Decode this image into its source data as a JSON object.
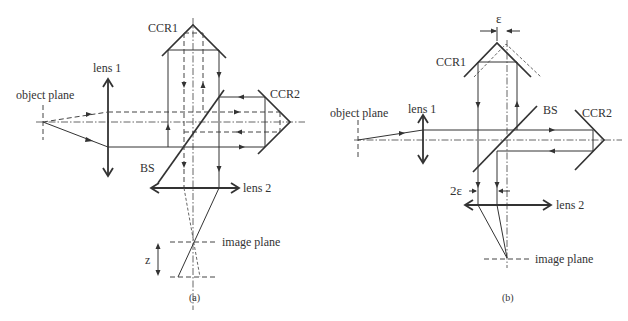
{
  "figure": {
    "panel_a": {
      "caption": "(a)",
      "labels": {
        "ccr1": "CCR1",
        "ccr2": "CCR2",
        "lens1": "lens 1",
        "lens2": "lens 2",
        "object_plane": "object plane",
        "bs": "BS",
        "image_plane": "image plane",
        "z": "z"
      }
    },
    "panel_b": {
      "caption": "(b)",
      "labels": {
        "ccr1": "CCR1",
        "ccr2": "CCR2",
        "lens1": "lens 1",
        "lens2": "lens 2",
        "object_plane": "object plane",
        "bs": "BS",
        "image_plane": "image plane",
        "epsilon": "ε",
        "two_epsilon": "2ε"
      }
    },
    "colors": {
      "ink": "#333333",
      "background": "#ffffff"
    }
  }
}
